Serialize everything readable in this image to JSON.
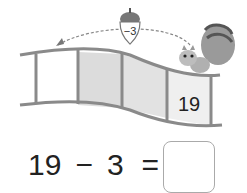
{
  "illustration": {
    "acorn_label": "−3",
    "start_cell_value": "19",
    "film_cells": 4,
    "colors": {
      "strip": "#8a8a8a",
      "shade": "#dcdcdc",
      "arrow": "#888888"
    }
  },
  "equation": {
    "left": "19",
    "operator": "−",
    "right": "3",
    "equals": "=",
    "answer": ""
  }
}
